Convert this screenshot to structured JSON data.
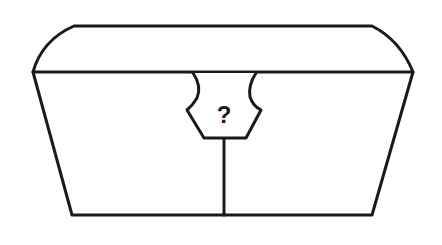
{
  "figure": {
    "lock": {
      "symbol": "?"
    },
    "colors": {
      "stroke": "#1a1a1a",
      "background": "#ffffff"
    }
  }
}
